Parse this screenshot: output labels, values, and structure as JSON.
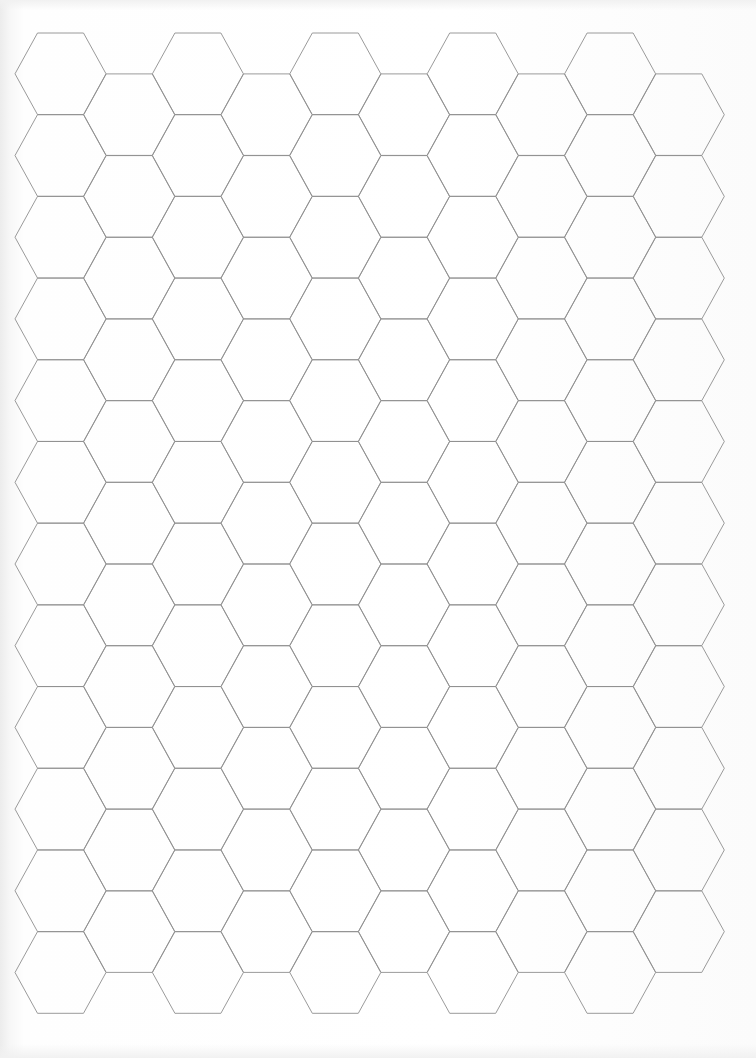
{
  "document": {
    "type": "hexagonal-grid-paper",
    "hex_orientation": "flat-top",
    "columns": 10,
    "hexes_in_even_columns": 12,
    "hexes_in_odd_columns": 11,
    "origin_center_x": 60.5,
    "origin_center_y": 73.8,
    "column_pitch": 68.7,
    "row_pitch": 81.7,
    "hex_half_width": 45.5,
    "hex_top_half_width": 23,
    "hex_half_height": 40.8,
    "odd_column_offset_y": 40.85,
    "colors": {
      "line": "#8e8e8e",
      "paper": "#ffffff"
    }
  }
}
